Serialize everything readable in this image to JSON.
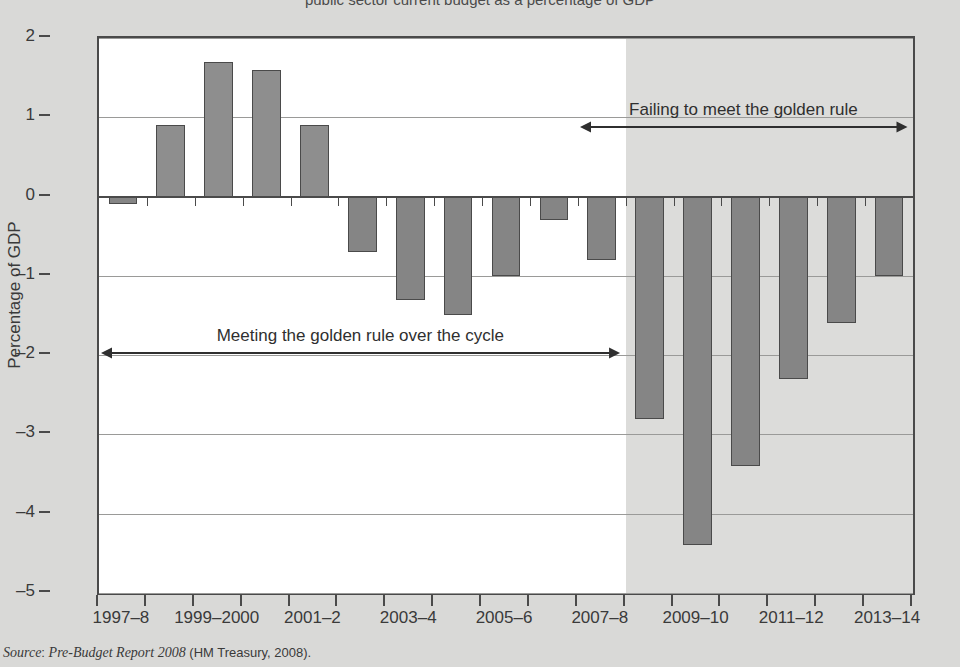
{
  "figure": {
    "partial_title": "public sector current budget as a percentage of GDP"
  },
  "axes": {
    "ylabel": "Percentage of GDP",
    "yticks": [
      "2",
      "1",
      "0",
      "–1",
      "–2",
      "–3",
      "–4",
      "–5"
    ],
    "xticklabels": [
      "1997–8",
      "1999–2000",
      "2001–2",
      "2003–4",
      "2005–6",
      "2007–8",
      "2009–10",
      "2011–12",
      "2013–14"
    ]
  },
  "annotations": {
    "left": "Meeting the golden rule over the cycle",
    "right": "Failing to meet the golden rule"
  },
  "source": {
    "label": "Source",
    "colon": ": ",
    "title": "Pre-Budget Report 2008",
    "publisher": " (HM Treasury, 2008)."
  },
  "colors": {
    "bar_fill": "#8e8e8e",
    "bar_edge": "#4a4a4a",
    "page_bg": "#d9d9d7",
    "plot_bg": "#ffffff",
    "forecast_shade": "#dcdcda",
    "gridline": "#9a9a98"
  },
  "chart_data": {
    "type": "bar",
    "title": "Public sector current budget as a percentage of GDP",
    "xlabel": "",
    "ylabel": "Percentage of GDP",
    "ylim": [
      -5,
      2
    ],
    "ytick_values": [
      2,
      1,
      0,
      -1,
      -2,
      -3,
      -4,
      -5
    ],
    "grid": true,
    "legend": null,
    "categories": [
      "1997–8",
      "1998–9",
      "1999–2000",
      "2000–1",
      "2001–2",
      "2002–3",
      "2003–4",
      "2004–5",
      "2005–6",
      "2006–7",
      "2007–8",
      "2008–9",
      "2009–10",
      "2010–11",
      "2011–12",
      "2012–13",
      "2013–14"
    ],
    "values": [
      -0.1,
      0.9,
      1.7,
      1.6,
      0.9,
      -0.7,
      -1.3,
      -1.5,
      -1.0,
      -0.3,
      -0.8,
      -2.8,
      -4.4,
      -3.4,
      -2.3,
      -1.6,
      -1.0
    ],
    "labelled_categories": [
      "1997–8",
      "1999–2000",
      "2001–2",
      "2003–4",
      "2005–6",
      "2007–8",
      "2009–10",
      "2011–12",
      "2013–14"
    ],
    "forecast_starts_at": "2008–9",
    "annotations": [
      {
        "text": "Meeting the golden rule over the cycle",
        "from": "1997–8",
        "to": "2007–8",
        "y": -2
      },
      {
        "text": "Failing to meet the golden rule",
        "from": "2007–8",
        "to": "2013–14",
        "y": 0.85
      }
    ]
  }
}
